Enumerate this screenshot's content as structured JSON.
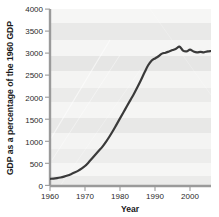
{
  "chart_data": {
    "type": "line",
    "title": "",
    "xlabel": "Year",
    "ylabel": "GDP as a percentage of the 1960 GDP",
    "xlim": [
      1960,
      2006
    ],
    "ylim": [
      0,
      4000
    ],
    "xticks": [
      1960,
      1970,
      1980,
      1990,
      2000
    ],
    "xtick_labels": [
      "1960",
      "1970",
      "1980",
      "1990",
      "2000"
    ],
    "yticks": [
      0,
      500,
      1000,
      1500,
      2000,
      2500,
      3000,
      3500,
      4000
    ],
    "ytick_labels": [
      "0",
      "500",
      "1000",
      "1500",
      "2000",
      "2500",
      "3000",
      "3500",
      "4000"
    ],
    "grid": false,
    "legend": "none",
    "background_bands": "alternating light grey horizontal bands",
    "line_color": "#3a3a3a",
    "series": [
      {
        "name": "GDP index (1960 = 100)",
        "x": [
          1960,
          1961,
          1962,
          1963,
          1964,
          1965,
          1966,
          1967,
          1968,
          1969,
          1970,
          1971,
          1972,
          1973,
          1974,
          1975,
          1976,
          1977,
          1978,
          1979,
          1980,
          1981,
          1982,
          1983,
          1984,
          1985,
          1986,
          1987,
          1988,
          1989,
          1990,
          1991,
          1992,
          1993,
          1994,
          1995,
          1996,
          1997,
          1998,
          1999,
          2000,
          2001,
          2002,
          2003,
          2004,
          2005,
          2006
        ],
        "values": [
          150,
          155,
          165,
          180,
          200,
          225,
          255,
          290,
          330,
          380,
          440,
          520,
          610,
          700,
          790,
          880,
          990,
          1110,
          1240,
          1380,
          1520,
          1660,
          1800,
          1940,
          2080,
          2230,
          2390,
          2560,
          2720,
          2830,
          2880,
          2930,
          2990,
          3010,
          3040,
          3070,
          3100,
          3150,
          3060,
          3040,
          3080,
          3040,
          3020,
          3030,
          3020,
          3040,
          3050
        ]
      }
    ]
  },
  "axes": {
    "x_label": "Year",
    "y_label": "GDP as a percentage of the 1960 GDP"
  }
}
